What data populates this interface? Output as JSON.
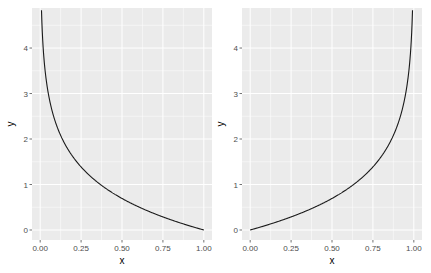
{
  "chart_data": [
    {
      "type": "line",
      "title": "",
      "xlabel": "x",
      "ylabel": "y",
      "function": "y = -ln(x)",
      "xlim": [
        -0.05,
        1.05
      ],
      "ylim": [
        -0.22,
        4.88
      ],
      "x_ticks": [
        "0.00",
        "0.25",
        "0.50",
        "0.75",
        "1.00"
      ],
      "y_ticks": [
        "0",
        "1",
        "2",
        "3",
        "4"
      ],
      "grid": true,
      "legend": null,
      "series": [
        {
          "name": "curve",
          "x": [
            0.008,
            0.02,
            0.05,
            0.1,
            0.15,
            0.2,
            0.25,
            0.3,
            0.4,
            0.5,
            0.6,
            0.7,
            0.75,
            0.8,
            0.9,
            1.0
          ],
          "y": [
            4.83,
            3.91,
            3.0,
            2.3,
            1.9,
            1.61,
            1.39,
            1.2,
            0.92,
            0.69,
            0.51,
            0.36,
            0.29,
            0.22,
            0.11,
            0.0
          ]
        }
      ]
    },
    {
      "type": "line",
      "title": "",
      "xlabel": "x",
      "ylabel": "y",
      "function": "y = -ln(1 - x)",
      "xlim": [
        -0.05,
        1.05
      ],
      "ylim": [
        -0.22,
        4.88
      ],
      "x_ticks": [
        "0.00",
        "0.25",
        "0.50",
        "0.75",
        "1.00"
      ],
      "y_ticks": [
        "0",
        "1",
        "2",
        "3",
        "4"
      ],
      "grid": true,
      "legend": null,
      "series": [
        {
          "name": "curve",
          "x": [
            0.0,
            0.1,
            0.2,
            0.25,
            0.3,
            0.4,
            0.5,
            0.6,
            0.7,
            0.75,
            0.8,
            0.85,
            0.9,
            0.95,
            0.98,
            0.992
          ],
          "y": [
            0.0,
            0.11,
            0.22,
            0.29,
            0.36,
            0.51,
            0.69,
            0.92,
            1.2,
            1.39,
            1.61,
            1.9,
            2.3,
            3.0,
            3.91,
            4.83
          ]
        }
      ]
    }
  ],
  "style": {
    "panel_bg": "#ebebeb",
    "grid_major": "#ffffff",
    "line_color": "#1a1a1a",
    "tick_color": "#4d4d4d"
  }
}
